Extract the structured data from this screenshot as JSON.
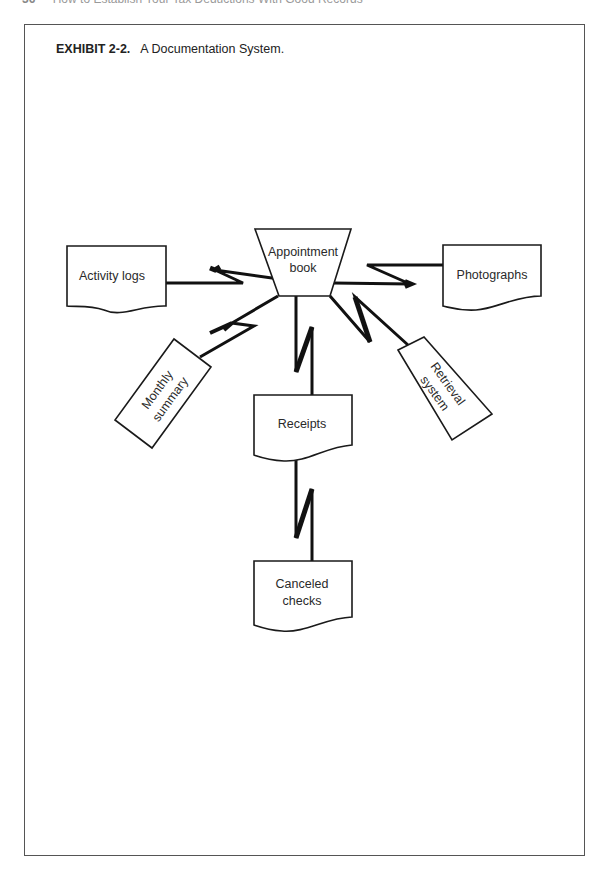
{
  "running_head": {
    "page_number": "36",
    "title": "How to Establish Your Tax Deductions With Good Records"
  },
  "exhibit": {
    "label": "EXHIBIT 2-2.",
    "title": "A Documentation System."
  },
  "diagram": {
    "center": {
      "id": "appointment-book",
      "lines": [
        "Appointment",
        "book"
      ],
      "shape": "manual-operation"
    },
    "nodes": [
      {
        "id": "activity-logs",
        "lines": [
          "Activity logs"
        ],
        "shape": "document"
      },
      {
        "id": "photographs",
        "lines": [
          "Photographs"
        ],
        "shape": "document"
      },
      {
        "id": "monthly-summary",
        "lines": [
          "Monthly",
          "summary"
        ],
        "shape": "rectangle"
      },
      {
        "id": "receipts",
        "lines": [
          "Receipts"
        ],
        "shape": "document"
      },
      {
        "id": "retrieval-system",
        "lines": [
          "Retrieval",
          "system"
        ],
        "shape": "manual-operation"
      },
      {
        "id": "canceled-checks",
        "lines": [
          "Canceled",
          "checks"
        ],
        "shape": "document"
      }
    ],
    "connections": [
      [
        "appointment-book",
        "activity-logs"
      ],
      [
        "appointment-book",
        "photographs"
      ],
      [
        "appointment-book",
        "monthly-summary"
      ],
      [
        "appointment-book",
        "receipts"
      ],
      [
        "appointment-book",
        "retrieval-system"
      ],
      [
        "receipts",
        "canceled-checks"
      ]
    ]
  }
}
